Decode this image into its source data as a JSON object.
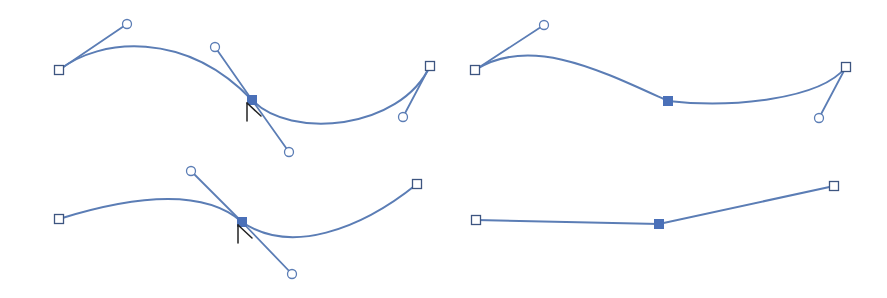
{
  "colors": {
    "path": "#5b7db5",
    "handle_line": "#5b7db5",
    "handle_point_stroke": "#5b7db5",
    "anchor_open_stroke": "#3d5580",
    "anchor_selected_fill": "#4a70b8",
    "cursor": "#222222",
    "background": "#ffffff"
  },
  "panels": [
    {
      "id": "top-left",
      "description": "Smooth curve with selected middle anchor showing both direction handles; cursor on anchor",
      "path_d": "M59,70 C100,38 185,30 252,100 C290,140 400,130 430,66",
      "anchors": [
        {
          "x": 59,
          "y": 70,
          "selected": false
        },
        {
          "x": 252,
          "y": 100,
          "selected": true
        },
        {
          "x": 430,
          "y": 66,
          "selected": false
        }
      ],
      "handles": [
        {
          "from": {
            "x": 59,
            "y": 70
          },
          "to": {
            "x": 127,
            "y": 24
          }
        },
        {
          "from": {
            "x": 252,
            "y": 100
          },
          "to": {
            "x": 215,
            "y": 47
          }
        },
        {
          "from": {
            "x": 252,
            "y": 100
          },
          "to": {
            "x": 289,
            "y": 152
          }
        },
        {
          "from": {
            "x": 430,
            "y": 66
          },
          "to": {
            "x": 403,
            "y": 117
          }
        }
      ],
      "cursor": {
        "x": 247,
        "y": 103,
        "visible": true
      }
    },
    {
      "id": "top-right",
      "description": "Curve after converting middle anchor: handles removed at selected anchor",
      "path_d": "M475,70 C530,35 600,70 668,101 C730,108 820,100 846,67",
      "anchors": [
        {
          "x": 475,
          "y": 70,
          "selected": false
        },
        {
          "x": 668,
          "y": 101,
          "selected": true
        },
        {
          "x": 846,
          "y": 67,
          "selected": false
        }
      ],
      "handles": [
        {
          "from": {
            "x": 475,
            "y": 70
          },
          "to": {
            "x": 544,
            "y": 25
          }
        },
        {
          "from": {
            "x": 846,
            "y": 67
          },
          "to": {
            "x": 819,
            "y": 118
          }
        }
      ],
      "cursor": {
        "visible": false
      }
    },
    {
      "id": "bottom-left",
      "description": "Smooth curve with selected middle anchor showing both direction handles; cursor on anchor",
      "path_d": "M59,219 C120,200 200,185 242,222 C290,255 360,230 417,184",
      "anchors": [
        {
          "x": 59,
          "y": 219,
          "selected": false
        },
        {
          "x": 242,
          "y": 222,
          "selected": true
        },
        {
          "x": 417,
          "y": 184,
          "selected": false
        }
      ],
      "handles": [
        {
          "from": {
            "x": 242,
            "y": 222
          },
          "to": {
            "x": 191,
            "y": 171
          }
        },
        {
          "from": {
            "x": 242,
            "y": 222
          },
          "to": {
            "x": 292,
            "y": 274
          }
        }
      ],
      "cursor": {
        "x": 238,
        "y": 225,
        "visible": true
      }
    },
    {
      "id": "bottom-right",
      "description": "Straight segments after converting anchor to corner point",
      "path_d": "M476,220 L659,224 L834,186",
      "anchors": [
        {
          "x": 476,
          "y": 220,
          "selected": false
        },
        {
          "x": 659,
          "y": 224,
          "selected": true
        },
        {
          "x": 834,
          "y": 186,
          "selected": false
        }
      ],
      "handles": [],
      "cursor": {
        "visible": false
      }
    }
  ],
  "legend_semantics": {
    "open_square": "unselected anchor point",
    "filled_square": "selected anchor point",
    "open_circle": "direction handle endpoint",
    "arrow_cursor": "convert anchor point tool cursor"
  }
}
